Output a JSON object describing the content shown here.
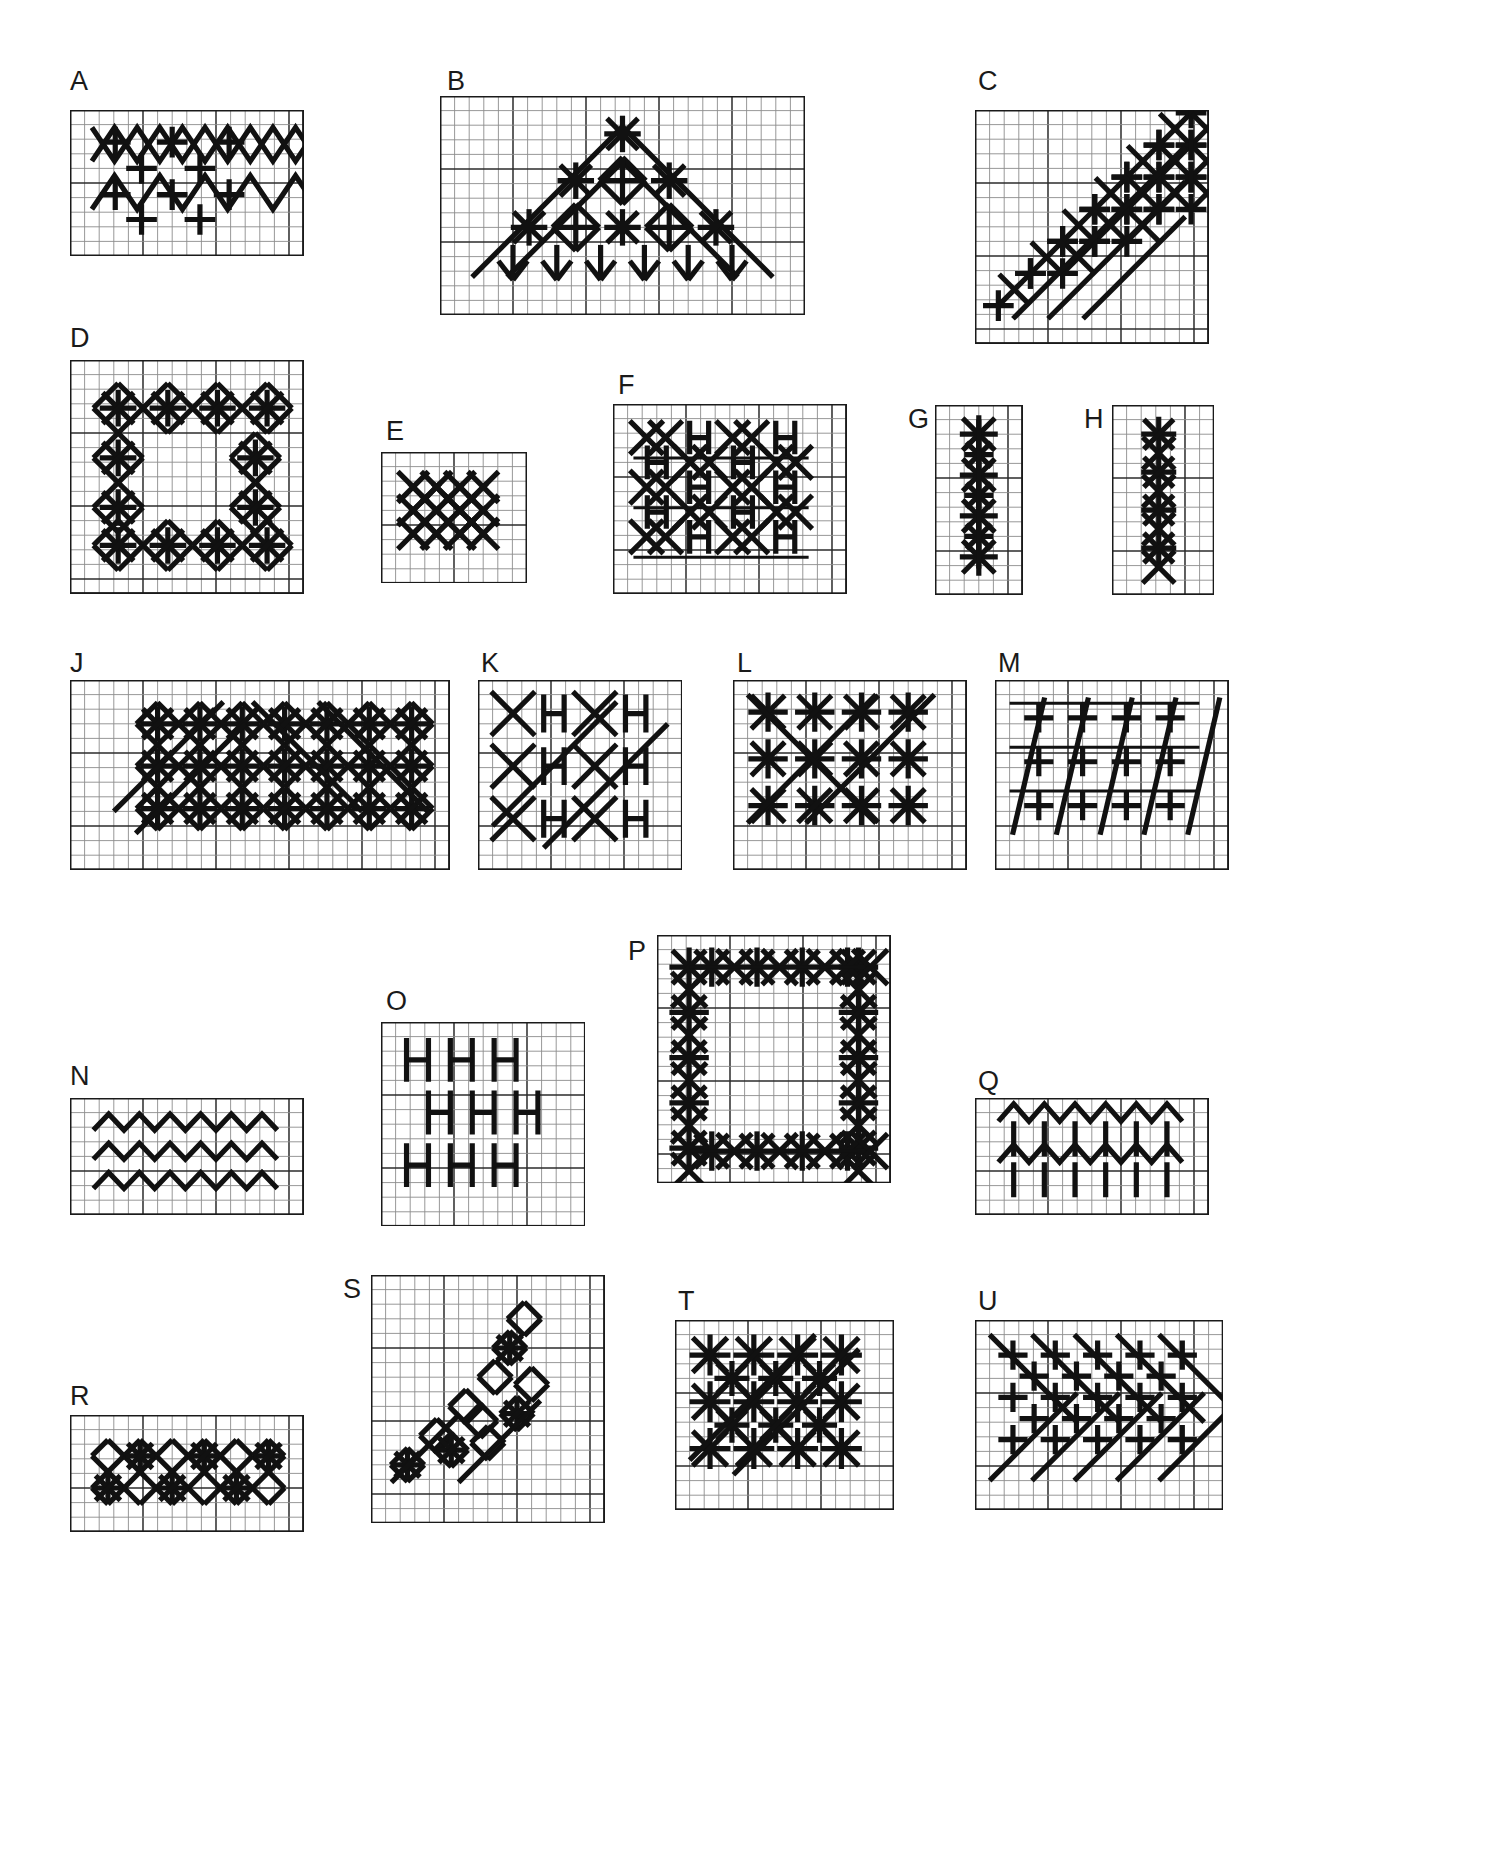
{
  "page": {
    "background_color": "#ffffff",
    "ink_color": "#111111",
    "grid_line_color": "#8c8c8c",
    "grid_major_color": "#2b2b2b",
    "grid_border_color": "#1a1a1a",
    "cell_size_px": 14.6,
    "major_every": 5,
    "stitch_stroke_px": 5.2,
    "thin_stroke_px": 3.0
  },
  "legend": {
    "stitch_types": [
      {
        "name": "upright-cross",
        "glyph": "+",
        "description": "Upright cross stitch spanning 2 grid cells"
      },
      {
        "name": "diagonal-cross",
        "glyph": "x",
        "description": "Diagonal cross stitch spanning 2 grid cells"
      },
      {
        "name": "eight-point-star",
        "glyph": "*",
        "description": "Combined upright and diagonal cross, eight rays"
      },
      {
        "name": "h-bar",
        "glyph": "H",
        "description": "Two vertical bars joined by a horizontal bar"
      },
      {
        "name": "long-diagonal",
        "glyph": "/",
        "description": "Long straight diagonal stitch"
      },
      {
        "name": "zigzag",
        "glyph": "v",
        "description": "Continuous zigzag line stitch"
      },
      {
        "name": "diamond-outline",
        "glyph": "<>",
        "description": "Diamond formed of four diagonal stitches"
      },
      {
        "name": "arrow",
        "glyph": "v",
        "description": "Chevron arrow stitch"
      }
    ]
  },
  "panels": [
    {
      "id": "A",
      "label": "A",
      "label_x": 70,
      "label_y": 68,
      "x": 70,
      "y": 110,
      "cols": 16,
      "rows": 10,
      "description": "Diagonal cross lattice with upright crosses in the open spaces"
    },
    {
      "id": "B",
      "label": "B",
      "label_x": 447,
      "label_y": 68,
      "x": 440,
      "y": 96,
      "cols": 25,
      "rows": 15,
      "description": "Triangular peak border with eyelet diamonds, star stitches and arrow chevrons"
    },
    {
      "id": "C",
      "label": "C",
      "label_x": 978,
      "label_y": 68,
      "x": 975,
      "y": 110,
      "cols": 16,
      "rows": 16,
      "description": "Rising diagonal stair-step band of upright and diagonal crosses"
    },
    {
      "id": "D",
      "label": "D",
      "label_x": 70,
      "label_y": 325,
      "x": 70,
      "y": 360,
      "cols": 16,
      "rows": 16,
      "description": "Open square frame of diamonds with eight-point star stitches at the corners"
    },
    {
      "id": "E",
      "label": "E",
      "label_x": 386,
      "label_y": 418,
      "x": 381,
      "y": 452,
      "cols": 10,
      "rows": 9,
      "description": "Compact block of interlocking diagonal crosses"
    },
    {
      "id": "F",
      "label": "F",
      "label_x": 618,
      "label_y": 372,
      "x": 613,
      "y": 404,
      "cols": 16,
      "rows": 13,
      "description": "Alternating diagonal cross lattice and H-bar stitch columns"
    },
    {
      "id": "G",
      "label": "G",
      "label_x": 908,
      "label_y": 406,
      "x": 935,
      "y": 405,
      "cols": 6,
      "rows": 13,
      "description": "Narrow vertical band of eight-point star stitches"
    },
    {
      "id": "H",
      "label": "H",
      "label_x": 1084,
      "label_y": 406,
      "x": 1112,
      "y": 405,
      "cols": 7,
      "rows": 13,
      "description": "Narrow vertical band of star stitches and diagonal crosses"
    },
    {
      "id": "J",
      "label": "J",
      "label_x": 70,
      "label_y": 650,
      "x": 70,
      "y": 680,
      "cols": 26,
      "rows": 13,
      "description": "Wide diamond trellis band with star stitches at each intersection"
    },
    {
      "id": "K",
      "label": "K",
      "label_x": 481,
      "label_y": 650,
      "x": 478,
      "y": 680,
      "cols": 14,
      "rows": 13,
      "description": "Large diagonal crosses alternating with paired H-bar stitches"
    },
    {
      "id": "L",
      "label": "L",
      "label_x": 737,
      "label_y": 650,
      "x": 733,
      "y": 680,
      "cols": 16,
      "rows": 13,
      "description": "Scattered eight-point star stitches crossed by long diagonals"
    },
    {
      "id": "M",
      "label": "M",
      "label_x": 998,
      "label_y": 650,
      "x": 995,
      "y": 680,
      "cols": 16,
      "rows": 13,
      "description": "Long diagonal stitches over a field of upright crosses"
    },
    {
      "id": "N",
      "label": "N",
      "label_x": 70,
      "label_y": 1063,
      "x": 70,
      "y": 1098,
      "cols": 16,
      "rows": 8,
      "description": "Three stacked rows of plain zigzag line stitch"
    },
    {
      "id": "O",
      "label": "O",
      "label_x": 386,
      "label_y": 988,
      "x": 381,
      "y": 1022,
      "cols": 14,
      "rows": 14,
      "description": "Offset H-bar stitches arranged in a staggered block"
    },
    {
      "id": "P",
      "label": "P",
      "label_x": 628,
      "label_y": 938,
      "x": 657,
      "y": 935,
      "cols": 16,
      "rows": 17,
      "description": "Square open frame built from star stitches and diagonal crosses"
    },
    {
      "id": "Q",
      "label": "Q",
      "label_x": 978,
      "label_y": 1068,
      "x": 975,
      "y": 1098,
      "cols": 16,
      "rows": 8,
      "description": "Zigzag rows with vertical stems forming arrow chevrons"
    },
    {
      "id": "R",
      "label": "R",
      "label_x": 70,
      "label_y": 1383,
      "x": 70,
      "y": 1415,
      "cols": 16,
      "rows": 8,
      "description": "Diamond trellis band with star stitches along the centre line"
    },
    {
      "id": "S",
      "label": "S",
      "label_x": 343,
      "label_y": 1276,
      "x": 371,
      "y": 1275,
      "cols": 16,
      "rows": 17,
      "description": "Ascending diagonal motif of interlocked diamonds and star stitches"
    },
    {
      "id": "T",
      "label": "T",
      "label_x": 678,
      "label_y": 1288,
      "x": 675,
      "y": 1320,
      "cols": 15,
      "rows": 13,
      "description": "Dense field of eight-point star stitches with long diagonals"
    },
    {
      "id": "U",
      "label": "U",
      "label_x": 978,
      "label_y": 1288,
      "x": 975,
      "y": 1320,
      "cols": 17,
      "rows": 13,
      "description": "Diagonal lattice band with upright crosses inside each lozenge"
    }
  ]
}
